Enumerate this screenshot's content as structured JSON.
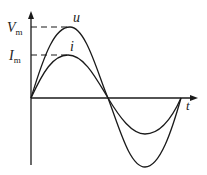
{
  "diagram": {
    "title": "",
    "axes": {
      "x_label": "t"
    },
    "levels": [
      {
        "label_main": "V",
        "label_sub": "m",
        "y": 27
      },
      {
        "label_main": "I",
        "label_sub": "m",
        "y": 55
      }
    ],
    "curves": [
      {
        "name": "u",
        "label": "u",
        "peak_y": 27,
        "trough_y": 167
      },
      {
        "name": "i",
        "label": "i",
        "peak_y": 55,
        "trough_y": 134
      }
    ],
    "colors": {
      "stroke": "#1a1a1a",
      "background": "#ffffff"
    }
  }
}
